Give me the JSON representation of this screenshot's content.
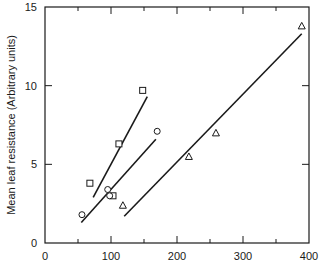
{
  "chart_data": {
    "type": "scatter",
    "title": "",
    "xlabel": "",
    "ylabel": "Mean leaf resistance (Arbitrary units)",
    "xlim": [
      0,
      400
    ],
    "ylim": [
      0,
      15
    ],
    "xticks": [
      0,
      100,
      200,
      300,
      400
    ],
    "xminor_ticks": [
      50,
      150,
      250,
      350
    ],
    "yticks": [
      0,
      5,
      10,
      15
    ],
    "grid": false,
    "legend": null,
    "series": [
      {
        "name": "squares",
        "marker": "square",
        "points": [
          [
            68,
            3.8
          ],
          [
            103,
            3.0
          ],
          [
            112,
            6.3
          ],
          [
            148,
            9.7
          ]
        ],
        "fit_line": [
          [
            73,
            2.9
          ],
          [
            155,
            9.3
          ]
        ]
      },
      {
        "name": "circles",
        "marker": "circle",
        "points": [
          [
            56,
            1.8
          ],
          [
            95,
            3.4
          ],
          [
            98,
            3.0
          ],
          [
            170,
            7.1
          ]
        ],
        "fit_line": [
          [
            55,
            1.3
          ],
          [
            168,
            6.6
          ]
        ]
      },
      {
        "name": "triangles",
        "marker": "triangle",
        "points": [
          [
            118,
            2.4
          ],
          [
            218,
            5.5
          ],
          [
            259,
            7.0
          ],
          [
            389,
            13.8
          ]
        ],
        "fit_line": [
          [
            120,
            1.7
          ],
          [
            389,
            13.3
          ]
        ]
      }
    ]
  }
}
